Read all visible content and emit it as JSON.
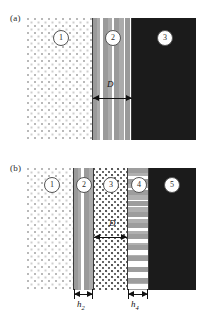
{
  "figure": {
    "caption_a": "(a)",
    "caption_b": "(b)",
    "background_color": "#ffffff",
    "line_color": "#3a3a3a"
  },
  "panel_a": {
    "label": "(a)",
    "regions": [
      {
        "number": "1",
        "fill": "sparse-dots",
        "name": "region-1"
      },
      {
        "number": "2",
        "fill": "horizontal-dash",
        "name": "region-2"
      },
      {
        "number": "3",
        "fill": "dense-squares",
        "name": "region-3"
      }
    ],
    "dimensions": [
      {
        "label": "D",
        "subscript": "",
        "spans": "region-2"
      }
    ]
  },
  "panel_b": {
    "label": "(b)",
    "regions": [
      {
        "number": "1",
        "fill": "sparse-dots",
        "name": "region-1"
      },
      {
        "number": "2",
        "fill": "horizontal-dash",
        "name": "region-2"
      },
      {
        "number": "3",
        "fill": "mid-dots",
        "name": "region-3"
      },
      {
        "number": "4",
        "fill": "vertical-dash",
        "name": "region-4"
      },
      {
        "number": "5",
        "fill": "dense-squares",
        "name": "region-5"
      }
    ],
    "dimensions": [
      {
        "label": "D",
        "subscript": "",
        "spans": "region-3"
      },
      {
        "label": "h",
        "subscript": "2",
        "spans": "region-2"
      },
      {
        "label": "h",
        "subscript": "4",
        "spans": "region-4"
      }
    ]
  },
  "labels": {
    "D": "D",
    "h": "h",
    "sub2": "2",
    "sub4": "4",
    "n1": "1",
    "n2": "2",
    "n3": "3",
    "n4": "4",
    "n5": "5"
  }
}
